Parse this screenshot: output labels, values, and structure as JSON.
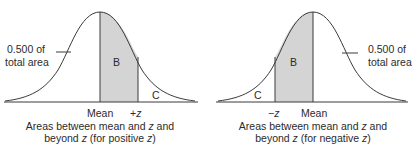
{
  "colors": {
    "line": "#3a3a3a",
    "shade": "#d4d4d4",
    "text": "#2b2b2b",
    "background": "#ffffff"
  },
  "left_panel": {
    "area_note_line1": "0.500 of",
    "area_note_line2": "total area",
    "region_b": "B",
    "region_c": "C",
    "mean_label": "Mean",
    "z_label_sign": "+",
    "z_label_var": "z",
    "caption_line1_a": "Areas between mean and ",
    "caption_line1_var": "z",
    "caption_line1_b": " and",
    "caption_line2_a": "beyond ",
    "caption_line2_var": "z",
    "caption_line2_b": " (for positive ",
    "caption_line2_var2": "z",
    "caption_line2_c": ")"
  },
  "right_panel": {
    "area_note_line1": "0.500 of",
    "area_note_line2": "total area",
    "region_b": "B",
    "region_c": "C",
    "mean_label": "Mean",
    "z_label_sign": "−",
    "z_label_var": "z",
    "caption_line1_a": "Areas between mean and ",
    "caption_line1_var": "z",
    "caption_line1_b": " and",
    "caption_line2_a": "beyond ",
    "caption_line2_var": "z",
    "caption_line2_b": " (for negative ",
    "caption_line2_var2": "z",
    "caption_line2_c": ")"
  }
}
